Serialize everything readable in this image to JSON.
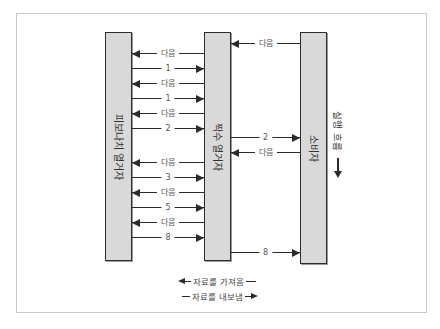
{
  "diagram": {
    "bars": {
      "left": {
        "label": "피보나치 열거자"
      },
      "middle": {
        "label": "짝수 열거자"
      },
      "right": {
        "label": "소비자"
      }
    },
    "flow_label": "실행 흐름",
    "left_to_middle": [
      {
        "dir": "left",
        "label": "다음"
      },
      {
        "dir": "right",
        "label": "1"
      },
      {
        "dir": "left",
        "label": "다음"
      },
      {
        "dir": "right",
        "label": "1"
      },
      {
        "dir": "left",
        "label": "다음"
      },
      {
        "dir": "right",
        "label": "2"
      },
      {
        "dir": "left",
        "label": "다음"
      },
      {
        "dir": "right",
        "label": "3"
      },
      {
        "dir": "left",
        "label": "다음"
      },
      {
        "dir": "right",
        "label": "5"
      },
      {
        "dir": "left",
        "label": "다음"
      },
      {
        "dir": "right",
        "label": "8"
      }
    ],
    "middle_to_right": [
      {
        "dir": "left",
        "label": "다음"
      },
      {
        "dir": "right",
        "label": "2"
      },
      {
        "dir": "left",
        "label": "다음"
      },
      {
        "dir": "right",
        "label": "8"
      }
    ],
    "legend": {
      "fetch": "자료를 가져옴",
      "emit": "자료를 내보냄"
    }
  }
}
